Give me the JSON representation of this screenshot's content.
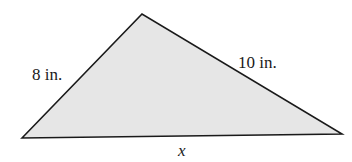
{
  "figure": {
    "type": "triangle",
    "vertices": {
      "bottom_left": [
        22,
        138
      ],
      "top": [
        142,
        14
      ],
      "bottom_right": [
        342,
        134
      ]
    },
    "fill_color": "#e6e6e6",
    "stroke_color": "#1a1a1a",
    "labels": {
      "left_side": "8 in.",
      "right_side": "10 in.",
      "base": "x"
    }
  }
}
